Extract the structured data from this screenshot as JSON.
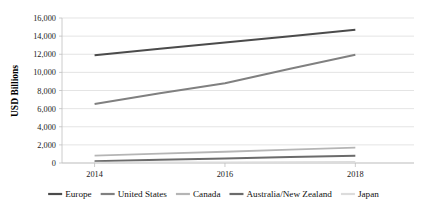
{
  "chart_data": {
    "type": "line",
    "title": "",
    "xlabel": "",
    "ylabel": "USD Billions",
    "x": [
      2014,
      2015,
      2016,
      2017,
      2018
    ],
    "xtick_values": [
      2014,
      2016,
      2018
    ],
    "xtick_labels": [
      "2014",
      "2016",
      "2018"
    ],
    "xlim": [
      2013.5,
      2018.9
    ],
    "ylim": [
      0,
      16000
    ],
    "ytick_values": [
      0,
      2000,
      4000,
      6000,
      8000,
      10000,
      12000,
      14000,
      16000
    ],
    "ytick_labels": [
      "0",
      "2,000",
      "4,000",
      "6,000",
      "8,000",
      "10,000",
      "12,000",
      "14,000",
      "16,000"
    ],
    "grid": "horizontal",
    "legend_position": "bottom",
    "series": [
      {
        "name": "Europe",
        "label": "Europe",
        "color": "#4b4b4b",
        "width": 2.0,
        "values": [
          11900,
          12600,
          13300,
          14000,
          14700
        ]
      },
      {
        "name": "United States",
        "label": "United States",
        "color": "#808080",
        "width": 2.0,
        "values": [
          6500,
          7700,
          8800,
          10400,
          11950
        ]
      },
      {
        "name": "Canada",
        "label": "Canada",
        "color": "#b5b5b5",
        "width": 1.8,
        "values": [
          820,
          1030,
          1240,
          1470,
          1700
        ]
      },
      {
        "name": "Australia/New Zealand",
        "label": "Australia/New Zealand",
        "color": "#6b6b6b",
        "width": 2.0,
        "values": [
          200,
          350,
          500,
          650,
          800
        ]
      },
      {
        "name": "Japan",
        "label": "Japan",
        "color": "#dcdcdc",
        "width": 1.6,
        "values": [
          60,
          75,
          90,
          105,
          120
        ]
      }
    ]
  },
  "axis": {
    "y_title": "USD Billions"
  },
  "legend": {
    "items": [
      {
        "label": "Europe",
        "color": "#4b4b4b"
      },
      {
        "label": "United States",
        "color": "#808080"
      },
      {
        "label": "Canada",
        "color": "#b5b5b5"
      },
      {
        "label": "Australia/New Zealand",
        "color": "#6b6b6b"
      },
      {
        "label": "Japan",
        "color": "#dcdcdc"
      }
    ]
  }
}
